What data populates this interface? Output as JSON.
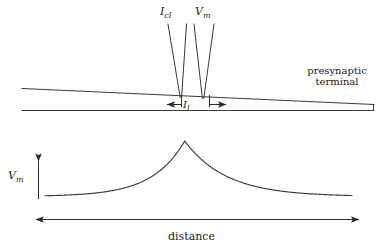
{
  "figure": {
    "width": 383,
    "height": 252,
    "background": "#ffffff",
    "line_color": "#3a3a3a",
    "text_color": "#1a1a1a"
  },
  "labels": {
    "electrode_current": {
      "base": "I",
      "sub": "cl"
    },
    "electrode_voltage": {
      "base": "V",
      "sub": "m"
    },
    "electrode_separation": {
      "base": "I",
      "sub": "l"
    },
    "terminal_line1": "presynaptic",
    "terminal_line2": "terminal",
    "y_axis": {
      "base": "V",
      "sub": "m"
    },
    "x_axis": "distance"
  },
  "top_panel": {
    "description": "wedge-shaped presynaptic terminal with two impaling electrodes",
    "membrane_top_line": {
      "x1": 22,
      "y1": 88,
      "x2": 374,
      "y2": 105
    },
    "membrane_bottom_line": {
      "x1": 22,
      "y1": 110,
      "x2": 374,
      "y2": 110
    },
    "terminal_right_edge": {
      "x": 374,
      "y1": 105,
      "y2": 110
    },
    "electrodes": [
      {
        "name": "I_cl",
        "tip_x": 181,
        "tip_y": 97,
        "top_left_x": 168,
        "top_right_x": 186,
        "top_y": 24
      },
      {
        "name": "V_m",
        "tip_x": 203,
        "tip_y": 98,
        "top_left_x": 194,
        "top_right_x": 214,
        "top_y": 24
      }
    ],
    "separation_arrow": {
      "x1": 166,
      "x2": 227,
      "y": 104,
      "tick_top_y": 95
    }
  },
  "chart_data": {
    "type": "line",
    "title": "",
    "xlabel": "distance",
    "ylabel": "V_m",
    "grid": false,
    "legend": null,
    "axis_style": "arrow",
    "xlim": [
      0,
      1
    ],
    "ylim": [
      0,
      1
    ],
    "peak_x": 0.455,
    "peak_y": 1.0,
    "baseline_y": 0.0,
    "decay_constant_left": 0.105,
    "decay_constant_right": 0.135,
    "x": [
      0.0,
      0.05,
      0.1,
      0.15,
      0.2,
      0.25,
      0.3,
      0.35,
      0.4,
      0.455,
      0.5,
      0.55,
      0.6,
      0.65,
      0.7,
      0.75,
      0.8,
      0.85,
      0.9,
      0.95,
      1.0
    ],
    "y": [
      0.013,
      0.021,
      0.034,
      0.055,
      0.088,
      0.141,
      0.226,
      0.362,
      0.58,
      1.0,
      0.716,
      0.495,
      0.342,
      0.236,
      0.163,
      0.113,
      0.078,
      0.054,
      0.037,
      0.026,
      0.018
    ]
  }
}
